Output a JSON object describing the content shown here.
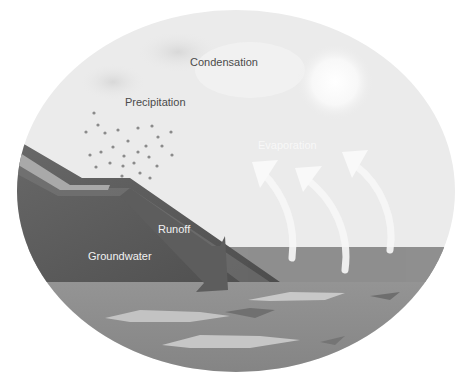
{
  "diagram": {
    "labels": {
      "condensation": "Condensation",
      "precipitation": "Precipitation",
      "evaporation": "Evaporation",
      "runoff": "Runoff",
      "groundwater": "Groundwater"
    },
    "colors": {
      "sky": "#e9e9e9",
      "sky_light": "#f6f6f6",
      "land_dark": "#555555",
      "land_mid": "#7a7a7a",
      "land_stripe": "#a8a8a8",
      "sea": "#8c8c8c",
      "sea_light": "#a5a5a5",
      "wave_light": "#c8c8c8",
      "wave_dark": "#6e6e6e",
      "arrow": "#f8f8f8",
      "text_dark": "#4a4a4a",
      "text_light": "#f2f2f2"
    }
  }
}
